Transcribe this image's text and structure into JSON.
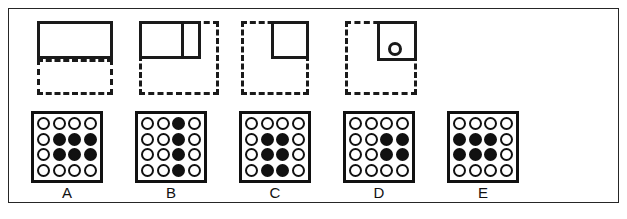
{
  "figure": {
    "title": "",
    "colors": {
      "ink": "#111111",
      "outline": "#1a1a1a",
      "frame": "#262626",
      "background": "#ffffff"
    }
  },
  "top_row": {
    "shapes": [
      {
        "id": "shape-a",
        "name": "wide-rectangle-over-dashed-rectangle",
        "solid": {
          "left": 14,
          "top": 4,
          "width": 76,
          "height": 38,
          "divided": false,
          "has_circle": false
        },
        "dashed": {
          "left": 14,
          "top": 42,
          "width": 76,
          "height": 36
        }
      },
      {
        "id": "shape-b",
        "name": "divided-rectangle-over-dashed-square",
        "solid": {
          "left": 12,
          "top": 4,
          "width": 62,
          "height": 38,
          "divided": true,
          "divider_x": 42,
          "has_circle": false
        },
        "dashed": {
          "left": 12,
          "top": 4,
          "width": 80,
          "height": 74
        }
      },
      {
        "id": "shape-c",
        "name": "small-square-in-dashed-square",
        "solid": {
          "left": 40,
          "top": 4,
          "width": 38,
          "height": 38,
          "divided": false,
          "has_circle": false
        },
        "dashed": {
          "left": 10,
          "top": 4,
          "width": 68,
          "height": 74
        }
      },
      {
        "id": "shape-d",
        "name": "square-with-circle-in-dashed-square",
        "solid": {
          "left": 40,
          "top": 4,
          "width": 40,
          "height": 40,
          "divided": false,
          "has_circle": true,
          "circle": {
            "left": 8,
            "top": 18,
            "size": 14
          }
        },
        "dashed": {
          "left": 8,
          "top": 4,
          "width": 72,
          "height": 74
        }
      }
    ]
  },
  "bottom_row": {
    "grid_rows": 4,
    "grid_cols": 4,
    "legend": {
      "filled": "filled-dot",
      "empty": "empty-dot"
    },
    "grids": [
      {
        "id": "grid-a",
        "label": "A",
        "filled_count": 6,
        "cells": [
          [
            0,
            0,
            0,
            0
          ],
          [
            0,
            1,
            1,
            1
          ],
          [
            0,
            1,
            1,
            1
          ],
          [
            0,
            0,
            0,
            0
          ]
        ]
      },
      {
        "id": "grid-b",
        "label": "B",
        "filled_count": 4,
        "cells": [
          [
            0,
            0,
            1,
            0
          ],
          [
            0,
            0,
            1,
            0
          ],
          [
            0,
            0,
            1,
            0
          ],
          [
            0,
            0,
            1,
            0
          ]
        ]
      },
      {
        "id": "grid-c",
        "label": "C",
        "filled_count": 6,
        "cells": [
          [
            0,
            0,
            0,
            0
          ],
          [
            0,
            1,
            1,
            0
          ],
          [
            0,
            1,
            1,
            0
          ],
          [
            0,
            1,
            1,
            0
          ]
        ]
      },
      {
        "id": "grid-d",
        "label": "D",
        "filled_count": 4,
        "cells": [
          [
            0,
            0,
            0,
            0
          ],
          [
            0,
            0,
            1,
            1
          ],
          [
            0,
            0,
            1,
            1
          ],
          [
            0,
            0,
            0,
            0
          ]
        ]
      },
      {
        "id": "grid-e",
        "label": "E",
        "filled_count": 6,
        "cells": [
          [
            0,
            0,
            0,
            0
          ],
          [
            1,
            1,
            1,
            0
          ],
          [
            1,
            1,
            1,
            0
          ],
          [
            0,
            0,
            0,
            0
          ]
        ]
      }
    ]
  }
}
